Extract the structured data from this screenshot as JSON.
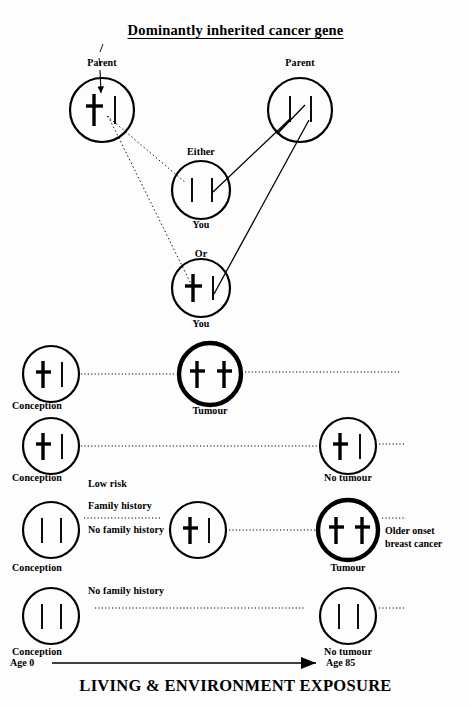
{
  "title": "Dominantly inherited cancer gene",
  "footer_title": "LIVING & ENVIRONMENT  EXPOSURE",
  "axis": {
    "start_label": "Age 0",
    "end_label": "Age 85"
  },
  "colors": {
    "ink": "#000000",
    "background": "#fdfdfd"
  },
  "pedigree": {
    "parent_left_label": "Parent",
    "parent_right_label": "Parent",
    "either_label": "Either",
    "or_label": "Or",
    "you_label_1": "You",
    "you_label_2": "You",
    "cells": {
      "parent_left": {
        "name": "parent-left-cell",
        "chromosomes": [
          "mutant",
          "normal"
        ],
        "thick": false
      },
      "parent_right": {
        "name": "parent-right-cell",
        "chromosomes": [
          "normal",
          "normal"
        ],
        "thick": false
      },
      "either_you": {
        "name": "either-you-cell",
        "chromosomes": [
          "normal",
          "normal"
        ],
        "thick": false
      },
      "or_you": {
        "name": "or-you-cell",
        "chromosomes": [
          "mutant",
          "normal"
        ],
        "thick": false
      }
    }
  },
  "timeline_rows": [
    {
      "id": "row-1",
      "left_label": "Conception",
      "left_chromosomes": [
        "mutant",
        "normal"
      ],
      "left_thick": false,
      "mid_label": "Tumour",
      "mid_chromosomes": [
        "mutant",
        "mutant"
      ],
      "mid_thick": true,
      "right_label": "",
      "right_chromosomes": [],
      "right_thick": false,
      "notes": []
    },
    {
      "id": "row-2",
      "left_label": "Conception",
      "left_chromosomes": [
        "mutant",
        "normal"
      ],
      "left_thick": false,
      "mid_label": "",
      "mid_chromosomes": [],
      "mid_thick": false,
      "right_label": "No tumour",
      "right_chromosomes": [
        "mutant",
        "normal"
      ],
      "right_thick": false,
      "notes": []
    },
    {
      "id": "row-3",
      "left_label": "Conception",
      "left_chromosomes": [
        "normal",
        "normal"
      ],
      "left_thick": false,
      "mid_label": "",
      "mid_chromosomes": [
        "mutant",
        "normal"
      ],
      "mid_thick": false,
      "right_label": "Tumour",
      "right_chromosomes": [
        "mutant",
        "mutant"
      ],
      "right_thick": true,
      "notes": [
        "Low risk",
        "Family history",
        "No family history"
      ],
      "right_note": "Older onset\nbreast cancer",
      "right_note_line1": "Older onset",
      "right_note_line2": "breast cancer"
    },
    {
      "id": "row-4",
      "left_label": "Conception",
      "left_chromosomes": [
        "normal",
        "normal"
      ],
      "left_thick": false,
      "mid_label": "",
      "mid_chromosomes": [],
      "mid_thick": false,
      "right_label": "No tumour",
      "right_chromosomes": [
        "normal",
        "normal"
      ],
      "right_thick": false,
      "notes": [
        "No family history"
      ]
    }
  ]
}
